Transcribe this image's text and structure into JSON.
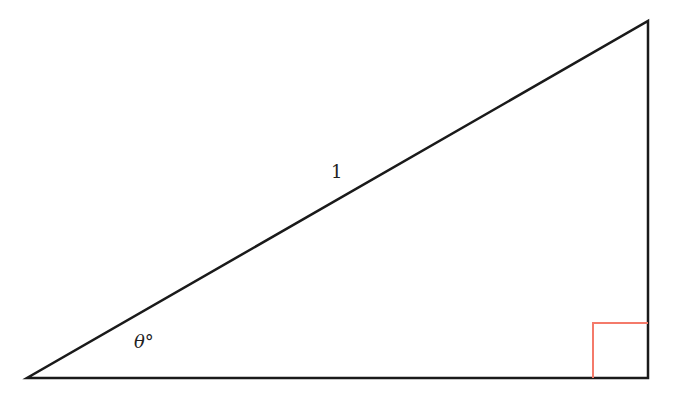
{
  "diagram": {
    "type": "right-triangle",
    "vertices": {
      "angle_vertex": [
        27,
        378
      ],
      "right_angle_vertex": [
        648,
        378
      ],
      "top_vertex": [
        648,
        21
      ]
    },
    "hypotenuse_label": "1",
    "angle_label": "θ°",
    "right_angle_marker": {
      "size": 55,
      "color": "#f47a6a"
    },
    "stroke_color": "#1a1a1a"
  }
}
